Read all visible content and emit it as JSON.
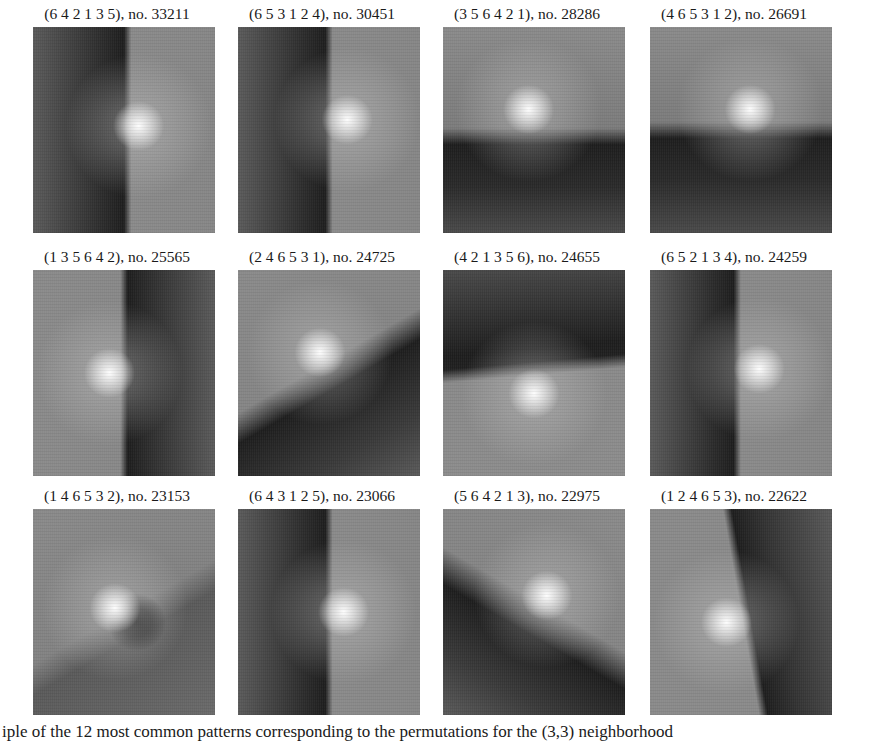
{
  "figure": {
    "panels": [
      {
        "perm": "(6  4  2  1  3  5)",
        "no": "no. 33211",
        "col": 0,
        "row": 0,
        "dark": {
          "x": 30,
          "y": 50,
          "w": 55,
          "h": 220,
          "angle": 0
        },
        "light": {
          "x": 58,
          "y": 48
        },
        "split": "vertical-left-dark",
        "edge": 52
      },
      {
        "perm": "(6  5  3  1  2  4)",
        "no": "no. 30451",
        "col": 1,
        "row": 0,
        "light": {
          "x": 60,
          "y": 45
        },
        "split": "vertical-left-dark",
        "edge": 50
      },
      {
        "perm": "(3  5  6  4  2  1)",
        "no": "no. 28286",
        "col": 2,
        "row": 0,
        "light": {
          "x": 47,
          "y": 40
        },
        "split": "horizontal-bottom-dark",
        "edge": 55
      },
      {
        "perm": "(4  6  5  3  1  2)",
        "no": "no. 26691",
        "col": 3,
        "row": 0,
        "light": {
          "x": 55,
          "y": 40
        },
        "split": "horizontal-bottom-dark",
        "edge": 52
      },
      {
        "perm": "(1  3  5  6  4  2)",
        "no": "no. 25565",
        "col": 0,
        "row": 1,
        "light": {
          "x": 42,
          "y": 50
        },
        "split": "vertical-right-dark",
        "edge": 50
      },
      {
        "perm": "(2  4  6  5  3  1)",
        "no": "no. 24725",
        "col": 1,
        "row": 1,
        "light": {
          "x": 45,
          "y": 40
        },
        "split": "diagonal-bottom-right-dark",
        "edge": 50
      },
      {
        "perm": "(4  2  1  3  5  6)",
        "no": "no. 24655",
        "col": 2,
        "row": 1,
        "light": {
          "x": 50,
          "y": 60
        },
        "split": "horizontal-top-dark",
        "edge": 45
      },
      {
        "perm": "(6  5  2  1  3  4)",
        "no": "no. 24259",
        "col": 3,
        "row": 1,
        "light": {
          "x": 60,
          "y": 48
        },
        "split": "vertical-left-dark",
        "edge": 48
      },
      {
        "perm": "(1  4  6  5  3  2)",
        "no": "no. 23153",
        "col": 0,
        "row": 2,
        "light": {
          "x": 45,
          "y": 48
        },
        "split": "diagonal-small-dark",
        "edge": 50
      },
      {
        "perm": "(6  4  3  1  2  5)",
        "no": "no. 23066",
        "col": 1,
        "row": 2,
        "light": {
          "x": 58,
          "y": 50
        },
        "split": "vertical-left-dark",
        "edge": 50
      },
      {
        "perm": "(5  6  4  2  1  3)",
        "no": "no. 22975",
        "col": 2,
        "row": 2,
        "light": {
          "x": 57,
          "y": 42
        },
        "split": "diagonal-bottom-left-dark",
        "edge": 50
      },
      {
        "perm": "(1  2  4  6  5  3)",
        "no": "no. 22622",
        "col": 3,
        "row": 2,
        "light": {
          "x": 42,
          "y": 55
        },
        "split": "vertical-right-dark-tilted",
        "edge": 52
      }
    ],
    "caption": "iple of the 12 most common patterns corresponding to the permutations for the (3,3) neighborhood"
  }
}
